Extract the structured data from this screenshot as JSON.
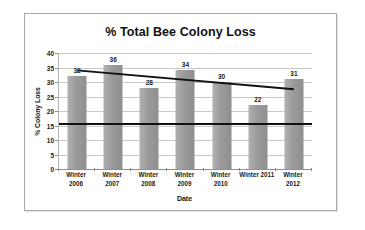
{
  "figure": {
    "frame_border_color": "#a9a9a9",
    "background": "#ffffff"
  },
  "chart_data": {
    "type": "bar",
    "title": "% Total Bee Colony Loss",
    "xlabel": "Date",
    "ylabel": "% Colony Loss",
    "categories": [
      "Winter\n2006",
      "Winter\n2007",
      "Winter\n2008",
      "Winter\n2009",
      "Winter\n2010",
      "Winter 2011",
      "Winter\n2012"
    ],
    "category_lines": [
      [
        "Winter",
        "2006"
      ],
      [
        "Winter",
        "2007"
      ],
      [
        "Winter",
        "2008"
      ],
      [
        "Winter",
        "2009"
      ],
      [
        "Winter",
        "2010"
      ],
      [
        "Winter 2011",
        ""
      ],
      [
        "Winter",
        "2012"
      ]
    ],
    "values": [
      32,
      36,
      28,
      34,
      30,
      22,
      31
    ],
    "value_labels": [
      "32",
      "36",
      "28",
      "34",
      "30",
      "22",
      "31"
    ],
    "ylim": [
      0,
      40
    ],
    "yticks": [
      0,
      5,
      10,
      15,
      20,
      25,
      30,
      35,
      40
    ],
    "ytick_labels": [
      "0",
      "5",
      "10",
      "15",
      "20",
      "25",
      "30",
      "35",
      "40"
    ],
    "grid": true,
    "legend": "none",
    "bar_color": "#9b9b9b",
    "annotations": [
      {
        "name": "trendline",
        "type": "line",
        "style": "solid",
        "color": "#111111",
        "start_value": 34,
        "end_value": 27.5
      },
      {
        "name": "threshold-line",
        "type": "hline",
        "style": "solid",
        "color": "#111111",
        "value": 15.5
      }
    ]
  }
}
